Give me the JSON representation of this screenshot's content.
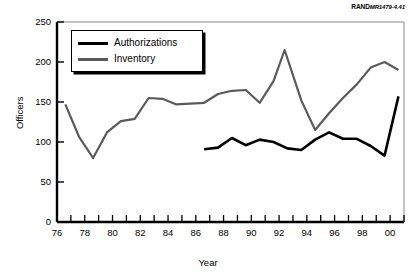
{
  "credit": {
    "brand": "RAND",
    "number": "MR1479-4.41"
  },
  "legend": {
    "position": "top-left-inside",
    "items": [
      {
        "label": "Authorizations",
        "color": "#000000"
      },
      {
        "label": "Inventory",
        "color": "#5a5a5a"
      }
    ]
  },
  "axes": {
    "ylabel": "Officers",
    "xlabel": "Year",
    "yticks": [
      "0",
      "50",
      "100",
      "150",
      "200",
      "250"
    ],
    "xticks": [
      "76",
      "78",
      "80",
      "82",
      "84",
      "86",
      "88",
      "90",
      "92",
      "94",
      "96",
      "98",
      "00"
    ]
  },
  "caption": {
    "text": ""
  },
  "chart_data": {
    "type": "line",
    "title": "",
    "xlabel": "Year",
    "ylabel": "Officers",
    "xlim": [
      76,
      101
    ],
    "ylim": [
      0,
      250
    ],
    "ytick_values": [
      0,
      50,
      100,
      150,
      200,
      250
    ],
    "xtick_values": [
      76,
      78,
      80,
      82,
      84,
      86,
      88,
      90,
      92,
      94,
      96,
      98,
      100
    ],
    "xtick_labels": [
      "76",
      "78",
      "80",
      "82",
      "84",
      "86",
      "88",
      "90",
      "92",
      "94",
      "96",
      "98",
      "00"
    ],
    "minor_xticks_every": 1,
    "grid": false,
    "legend": [
      "Authorizations",
      "Inventory"
    ],
    "legend_position": "upper left (inside axes)",
    "series": [
      {
        "name": "Inventory",
        "color": "#5a5a5a",
        "linewidth": 2.2,
        "x": [
          76.6,
          77.6,
          78.6,
          79.6,
          80.6,
          81.6,
          82.6,
          83.6,
          84.6,
          85.6,
          86.6,
          87.6,
          88.6,
          89.6,
          90.6,
          91.6,
          92.4,
          93.6,
          94.6,
          95.6,
          96.6,
          97.6,
          98.6,
          99.6,
          100.6
        ],
        "values": [
          147,
          106,
          80,
          112,
          126,
          129,
          155,
          154,
          147,
          148,
          149,
          160,
          164,
          165,
          149,
          176,
          215,
          152,
          115,
          136,
          155,
          172,
          193,
          200,
          190
        ]
      },
      {
        "name": "Authorizations",
        "color": "#000000",
        "linewidth": 2.6,
        "x": [
          86.6,
          87.6,
          88.6,
          89.6,
          90.6,
          91.6,
          92.6,
          93.6,
          94.6,
          95.6,
          96.6,
          97.6,
          98.6,
          99.6,
          100.6
        ],
        "values": [
          91,
          93,
          105,
          96,
          103,
          100,
          92,
          90,
          103,
          112,
          104,
          104,
          95,
          83,
          157
        ]
      }
    ]
  }
}
